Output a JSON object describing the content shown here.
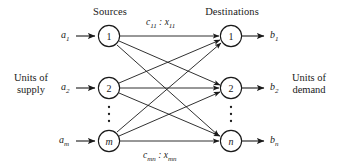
{
  "figure": {
    "type": "bipartite-transportation-network",
    "headers": {
      "sources": "Sources",
      "destinations": "Destinations"
    },
    "captions": {
      "left_line1": "Units of",
      "left_line2": "supply",
      "right_line1": "Units of",
      "right_line2": "demand"
    },
    "supply_labels": [
      {
        "base": "a",
        "sub": "1"
      },
      {
        "base": "a",
        "sub": "2"
      },
      {
        "base": "a",
        "sub": "m"
      }
    ],
    "demand_labels": [
      {
        "base": "b",
        "sub": "1"
      },
      {
        "base": "b",
        "sub": "2"
      },
      {
        "base": "b",
        "sub": "n"
      }
    ],
    "source_nodes": [
      {
        "label": "1",
        "italic": false
      },
      {
        "label": "2",
        "italic": false
      },
      {
        "label": "m",
        "italic": true
      }
    ],
    "destination_nodes": [
      {
        "label": "1",
        "italic": false
      },
      {
        "label": "2",
        "italic": false
      },
      {
        "label": "n",
        "italic": true
      }
    ],
    "edge_labels": {
      "top": {
        "c_base": "c",
        "c_sub": "11",
        "sep": " : ",
        "x_base": "x",
        "x_sub": "11"
      },
      "bottom": {
        "c_base": "c",
        "c_sub": "mn",
        "sep": " : ",
        "x_base": "x",
        "x_sub": "mn"
      }
    },
    "ellipsis_glyph": "⋮",
    "colors": {
      "ink": "#1a1a1a",
      "background": "#ffffff"
    }
  }
}
